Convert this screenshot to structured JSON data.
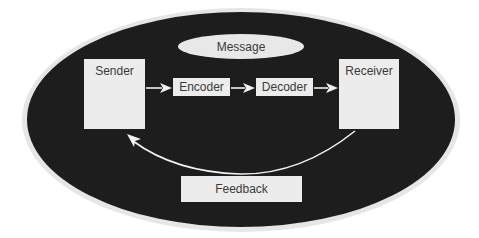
{
  "diagram": {
    "type": "communication-model",
    "message_label": "Message",
    "nodes": {
      "sender": "Sender",
      "encoder": "Encoder",
      "decoder": "Decoder",
      "receiver": "Receiver",
      "feedback": "Feedback"
    },
    "edges": [
      {
        "from": "Sender",
        "to": "Encoder"
      },
      {
        "from": "Encoder",
        "to": "Decoder"
      },
      {
        "from": "Decoder",
        "to": "Receiver"
      },
      {
        "from": "Receiver",
        "to": "Sender",
        "via": "Feedback",
        "curved": true
      }
    ],
    "colors": {
      "background": "#ffffff",
      "outer_ellipse": "#1d1d1d",
      "halo": "#e6e6e6",
      "box_fill": "#ececec",
      "text": "#3a3a3a",
      "arrow": "#f2f2f2"
    }
  }
}
